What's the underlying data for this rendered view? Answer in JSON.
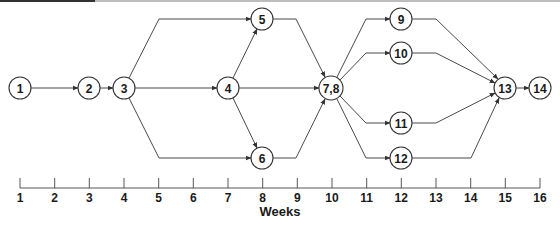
{
  "colors": {
    "stroke": "#333333",
    "edge": "#4a4a4a",
    "text": "#1a1a1a",
    "background": "#ffffff"
  },
  "diagram": {
    "type": "activity-network",
    "nodes": [
      {
        "id": "1",
        "label": "1",
        "x": 20,
        "y": 88,
        "r": 11
      },
      {
        "id": "2",
        "label": "2",
        "x": 89,
        "y": 88,
        "r": 11
      },
      {
        "id": "3",
        "label": "3",
        "x": 124,
        "y": 88,
        "r": 11
      },
      {
        "id": "4",
        "label": "4",
        "x": 228,
        "y": 88,
        "r": 11
      },
      {
        "id": "5",
        "label": "5",
        "x": 262,
        "y": 19,
        "r": 11
      },
      {
        "id": "6",
        "label": "6",
        "x": 262,
        "y": 158,
        "r": 11
      },
      {
        "id": "7,8",
        "label": "7,8",
        "x": 331,
        "y": 88,
        "r": 12
      },
      {
        "id": "9",
        "label": "9",
        "x": 401,
        "y": 19,
        "r": 11
      },
      {
        "id": "10",
        "label": "10",
        "x": 401,
        "y": 53,
        "r": 11
      },
      {
        "id": "11",
        "label": "11",
        "x": 401,
        "y": 123,
        "r": 11
      },
      {
        "id": "12",
        "label": "12",
        "x": 401,
        "y": 158,
        "r": 11
      },
      {
        "id": "13",
        "label": "13",
        "x": 505,
        "y": 88,
        "r": 11
      },
      {
        "id": "14",
        "label": "14",
        "x": 540,
        "y": 88,
        "r": 11
      }
    ],
    "edges": [
      {
        "from": "1",
        "to": "2",
        "points": [
          [
            31,
            88
          ],
          [
            78,
            88
          ]
        ]
      },
      {
        "from": "2",
        "to": "3",
        "points": [
          [
            100,
            88
          ],
          [
            113,
            88
          ]
        ]
      },
      {
        "from": "3",
        "to": "5",
        "points": [
          [
            129,
            78
          ],
          [
            159,
            19
          ],
          [
            251,
            19
          ]
        ]
      },
      {
        "from": "3",
        "to": "4",
        "points": [
          [
            135,
            88
          ],
          [
            217,
            88
          ]
        ]
      },
      {
        "from": "3",
        "to": "6",
        "points": [
          [
            129,
            98
          ],
          [
            159,
            158
          ],
          [
            251,
            158
          ]
        ]
      },
      {
        "from": "4",
        "to": "5",
        "points": [
          [
            233,
            78
          ],
          [
            257,
            29
          ]
        ]
      },
      {
        "from": "4",
        "to": "6",
        "points": [
          [
            233,
            98
          ],
          [
            257,
            148
          ]
        ]
      },
      {
        "from": "4",
        "to": "7,8",
        "points": [
          [
            239,
            88
          ],
          [
            319,
            88
          ]
        ]
      },
      {
        "from": "5",
        "to": "7,8",
        "points": [
          [
            273,
            19
          ],
          [
            296,
            19
          ],
          [
            325,
            77
          ]
        ]
      },
      {
        "from": "6",
        "to": "7,8",
        "points": [
          [
            273,
            158
          ],
          [
            296,
            158
          ],
          [
            325,
            99
          ]
        ]
      },
      {
        "from": "7,8",
        "to": "9",
        "points": [
          [
            337,
            77
          ],
          [
            366,
            19
          ],
          [
            390,
            19
          ]
        ]
      },
      {
        "from": "7,8",
        "to": "10",
        "points": [
          [
            340,
            80
          ],
          [
            366,
            53
          ],
          [
            390,
            53
          ]
        ]
      },
      {
        "from": "7,8",
        "to": "11",
        "points": [
          [
            340,
            96
          ],
          [
            366,
            123
          ],
          [
            390,
            123
          ]
        ]
      },
      {
        "from": "7,8",
        "to": "12",
        "points": [
          [
            337,
            99
          ],
          [
            366,
            158
          ],
          [
            390,
            158
          ]
        ]
      },
      {
        "from": "9",
        "to": "13",
        "points": [
          [
            412,
            19
          ],
          [
            436,
            19
          ],
          [
            498,
            79
          ]
        ]
      },
      {
        "from": "10",
        "to": "13",
        "points": [
          [
            412,
            53
          ],
          [
            436,
            53
          ],
          [
            495,
            83
          ]
        ]
      },
      {
        "from": "11",
        "to": "13",
        "points": [
          [
            412,
            123
          ],
          [
            436,
            123
          ],
          [
            495,
            93
          ]
        ]
      },
      {
        "from": "12",
        "to": "13",
        "points": [
          [
            412,
            158
          ],
          [
            471,
            158
          ],
          [
            499,
            98
          ]
        ]
      },
      {
        "from": "13",
        "to": "14",
        "points": [
          [
            516,
            88
          ],
          [
            529,
            88
          ]
        ]
      }
    ],
    "axis": {
      "title": "Weeks",
      "y_line": 188,
      "tick_top": 178,
      "label_y": 202,
      "title_x": 280,
      "title_y": 216,
      "x_start": 20,
      "x_end": 540,
      "ticks": [
        {
          "label": "1",
          "x": 20
        },
        {
          "label": "2",
          "x": 54.7
        },
        {
          "label": "3",
          "x": 89.3
        },
        {
          "label": "4",
          "x": 124
        },
        {
          "label": "5",
          "x": 158.7
        },
        {
          "label": "6",
          "x": 193.3
        },
        {
          "label": "7",
          "x": 228
        },
        {
          "label": "8",
          "x": 262.7
        },
        {
          "label": "9",
          "x": 297.3
        },
        {
          "label": "10",
          "x": 332
        },
        {
          "label": "11",
          "x": 366.7
        },
        {
          "label": "12",
          "x": 401.3
        },
        {
          "label": "13",
          "x": 436
        },
        {
          "label": "14",
          "x": 470.7
        },
        {
          "label": "15",
          "x": 505.3
        },
        {
          "label": "16",
          "x": 540
        }
      ]
    }
  }
}
